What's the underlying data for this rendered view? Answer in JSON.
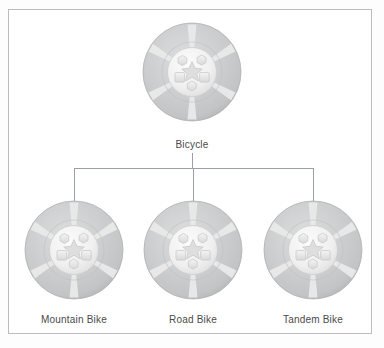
{
  "figure": {
    "background_color": "#ffffff",
    "frame_color": "#b9bcc0",
    "connector_color": "#9aa0a6",
    "label_color": "#4a4a4a"
  },
  "root_node": {
    "id": "bicycle",
    "label": "Bicycle",
    "icon": "bicycle-wheel-icon",
    "center_x": 192,
    "center_y": 72,
    "radius": 50
  },
  "child_nodes": [
    {
      "id": "mountain-bike",
      "label": "Mountain Bike",
      "icon": "bicycle-wheel-icon",
      "center_x": 74,
      "center_y": 250,
      "radius": 49
    },
    {
      "id": "road-bike",
      "label": "Road Bike",
      "icon": "bicycle-wheel-icon",
      "center_x": 193,
      "center_y": 250,
      "radius": 49
    },
    {
      "id": "tandem-bike",
      "label": "Tandem Bike",
      "icon": "bicycle-wheel-icon",
      "center_x": 313,
      "center_y": 250,
      "radius": 49
    }
  ],
  "connectors": {
    "trunk": {
      "x": 192,
      "y_top": 153,
      "y_bottom": 168
    },
    "crossbar": {
      "y": 168,
      "x_left": 74,
      "x_right": 313
    },
    "drops": [
      {
        "x": 74,
        "y_top": 168,
        "y_bottom": 203
      },
      {
        "x": 193,
        "y_top": 168,
        "y_bottom": 201
      },
      {
        "x": 313,
        "y_top": 168,
        "y_bottom": 203
      }
    ]
  },
  "wheel_icon": {
    "name": "bicycle-wheel-icon",
    "description": "Gray disc wheel with radial light spokes, light circular hub, two hex bolts on top, two square bolts in the middle, one hex bolt at bottom, and a central star",
    "tire_color": "#c9cbcc",
    "spoke_color": "#ececec",
    "hub_color": "#f2f2f2",
    "bolt_color": "#e4e4e4",
    "star_color": "#dcdcdc",
    "bolt_count": 5,
    "spoke_count": 6
  }
}
